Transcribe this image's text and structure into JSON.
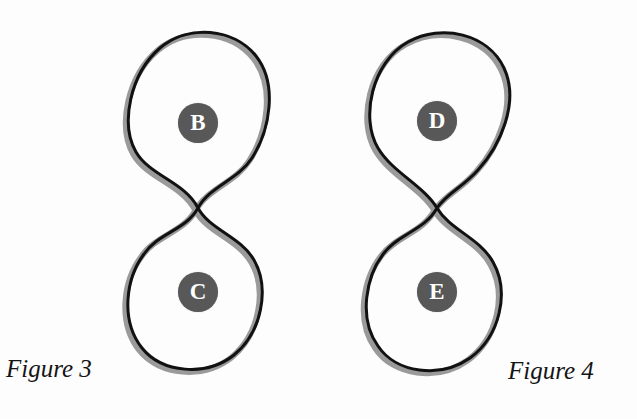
{
  "page": {
    "background_color": "#fdfdfd",
    "width": 637,
    "height": 419
  },
  "style": {
    "stroke_color": "#111111",
    "shadow_color": "#9a9a9a",
    "badge_fill": "#585858",
    "badge_text_color": "#ffffff",
    "caption_color": "#141414"
  },
  "figures": [
    {
      "id": "figure-3",
      "caption": "Figure 3",
      "caption_position": "bottom-left",
      "shape": "figure-eight",
      "crossing_point": {
        "x": 198,
        "y": 208
      },
      "regions": [
        {
          "id": "region-b",
          "label": "B",
          "position": "upper-loop",
          "center": {
            "x": 198,
            "y": 123
          },
          "loop_bounds": {
            "left": 125,
            "right": 273,
            "top": 35,
            "bottom": 208
          }
        },
        {
          "id": "region-c",
          "label": "C",
          "position": "lower-loop",
          "center": {
            "x": 198,
            "y": 292
          },
          "loop_bounds": {
            "left": 125,
            "right": 272,
            "top": 208,
            "bottom": 368
          }
        }
      ]
    },
    {
      "id": "figure-4",
      "caption": "Figure 4",
      "caption_position": "bottom-right",
      "shape": "figure-eight",
      "crossing_point": {
        "x": 437,
        "y": 208
      },
      "regions": [
        {
          "id": "region-d",
          "label": "D",
          "position": "upper-loop",
          "center": {
            "x": 437,
            "y": 121
          },
          "loop_bounds": {
            "left": 368,
            "right": 510,
            "top": 33,
            "bottom": 208
          }
        },
        {
          "id": "region-e",
          "label": "E",
          "position": "lower-loop",
          "center": {
            "x": 437,
            "y": 292
          },
          "loop_bounds": {
            "left": 370,
            "right": 508,
            "top": 208,
            "bottom": 378
          }
        }
      ]
    }
  ]
}
